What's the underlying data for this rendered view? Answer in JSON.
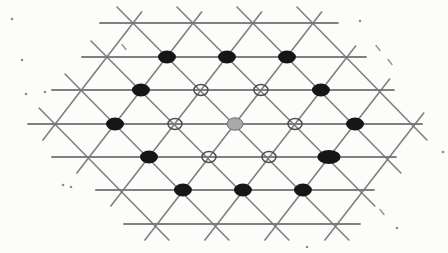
{
  "figure": {
    "background_color": "#fcfcfa",
    "line_color": "#767676",
    "filled_site_color": "#161616",
    "crossed_site_stroke": "#4d4d4d",
    "shaded_site_fill": "#a9a9a9",
    "shaded_site_stroke": "#6e6e6e",
    "speck_color": "#8f8f8f"
  },
  "lattice": {
    "shear": 0.12,
    "shear_center_y": 124,
    "horizontal_line_width": 1.8,
    "diagonal_line_width": 1.6,
    "horizontal_lines": [
      {
        "y": 23,
        "x1": 112,
        "x2": 350
      },
      {
        "y": 57,
        "x1": 90,
        "x2": 374
      },
      {
        "y": 90,
        "x1": 56,
        "x2": 398
      },
      {
        "y": 124,
        "x1": 28,
        "x2": 422
      },
      {
        "y": 157,
        "x1": 48,
        "x2": 392
      },
      {
        "y": 190,
        "x1": 88,
        "x2": 366
      },
      {
        "y": 224,
        "x1": 112,
        "x2": 348
      }
    ],
    "diagonal_lines": [
      {
        "x1": 41,
        "y1": 140,
        "x2": 155,
        "y2": 12
      },
      {
        "x1": 71,
        "y1": 173,
        "x2": 215,
        "y2": 12
      },
      {
        "x1": 101,
        "y1": 206,
        "x2": 275,
        "y2": 12
      },
      {
        "x1": 131,
        "y1": 240,
        "x2": 335,
        "y2": 12
      },
      {
        "x1": 191,
        "y1": 240,
        "x2": 365,
        "y2": 46
      },
      {
        "x1": 251,
        "y1": 240,
        "x2": 395,
        "y2": 79
      },
      {
        "x1": 311,
        "y1": 240,
        "x2": 425,
        "y2": 113
      },
      {
        "x1": 41,
        "y1": 108,
        "x2": 155,
        "y2": 240
      },
      {
        "x1": 71,
        "y1": 74,
        "x2": 215,
        "y2": 240
      },
      {
        "x1": 101,
        "y1": 41,
        "x2": 275,
        "y2": 240
      },
      {
        "x1": 131,
        "y1": 7,
        "x2": 335,
        "y2": 240
      },
      {
        "x1": 191,
        "y1": 7,
        "x2": 365,
        "y2": 206
      },
      {
        "x1": 251,
        "y1": 7,
        "x2": 395,
        "y2": 173
      },
      {
        "x1": 311,
        "y1": 7,
        "x2": 425,
        "y2": 140
      }
    ]
  },
  "markers": {
    "filled": [
      {
        "x": 175,
        "y": 57
      },
      {
        "x": 235,
        "y": 57
      },
      {
        "x": 295,
        "y": 57
      },
      {
        "x": 145,
        "y": 90
      },
      {
        "x": 325,
        "y": 90
      },
      {
        "x": 115,
        "y": 124
      },
      {
        "x": 355,
        "y": 124
      },
      {
        "x": 145,
        "y": 157
      },
      {
        "x": 175,
        "y": 190
      },
      {
        "x": 235,
        "y": 190
      },
      {
        "x": 295,
        "y": 190
      }
    ],
    "filled_large": [
      {
        "x": 325,
        "y": 157
      }
    ],
    "crossed": [
      {
        "x": 205,
        "y": 90
      },
      {
        "x": 265,
        "y": 90
      },
      {
        "x": 175,
        "y": 124
      },
      {
        "x": 295,
        "y": 124
      },
      {
        "x": 205,
        "y": 157
      },
      {
        "x": 265,
        "y": 157
      }
    ],
    "shaded": [
      {
        "x": 235,
        "y": 124
      }
    ],
    "filled_rx": 9,
    "filled_ry": 6.5,
    "large_rx": 11.5,
    "large_ry": 7,
    "crossed_rx": 7,
    "crossed_ry": 5.5,
    "crossed_stroke_width": 1.5,
    "shaded_rx": 8,
    "shaded_ry": 6.2
  },
  "specks": [
    {
      "x": 12,
      "y": 19,
      "type": "dot"
    },
    {
      "x": 124,
      "y": 47,
      "type": "slash"
    },
    {
      "x": 22,
      "y": 60,
      "type": "dot"
    },
    {
      "x": 45,
      "y": 92,
      "type": "dot"
    },
    {
      "x": 26,
      "y": 94,
      "type": "dot"
    },
    {
      "x": 63,
      "y": 185,
      "type": "dot"
    },
    {
      "x": 71,
      "y": 187,
      "type": "dot"
    },
    {
      "x": 360,
      "y": 21,
      "type": "dot"
    },
    {
      "x": 378,
      "y": 48,
      "type": "slash"
    },
    {
      "x": 390,
      "y": 62,
      "type": "slash"
    },
    {
      "x": 443,
      "y": 152,
      "type": "dot"
    },
    {
      "x": 382,
      "y": 212,
      "type": "slash"
    },
    {
      "x": 397,
      "y": 228,
      "type": "dot"
    },
    {
      "x": 307,
      "y": 247,
      "type": "dot"
    }
  ]
}
